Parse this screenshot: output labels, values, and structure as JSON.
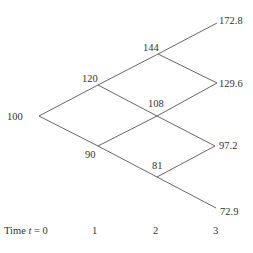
{
  "diagram": {
    "type": "binomial-tree",
    "nodes": [
      {
        "id": "n00",
        "value": "100",
        "x": 39,
        "y": 116,
        "label_x": 7,
        "label_y": 120,
        "anchor": "start"
      },
      {
        "id": "n10",
        "value": "120",
        "x": 98,
        "y": 85,
        "label_x": 82,
        "label_y": 82,
        "anchor": "start"
      },
      {
        "id": "n11",
        "value": "90",
        "x": 98,
        "y": 146,
        "label_x": 85,
        "label_y": 158,
        "anchor": "start"
      },
      {
        "id": "n20",
        "value": "144",
        "x": 158,
        "y": 54,
        "label_x": 143,
        "label_y": 51,
        "anchor": "start"
      },
      {
        "id": "n21",
        "value": "108",
        "x": 157,
        "y": 116,
        "label_x": 148,
        "label_y": 107,
        "anchor": "start"
      },
      {
        "id": "n22",
        "value": "81",
        "x": 157,
        "y": 177,
        "label_x": 152,
        "label_y": 169,
        "anchor": "start"
      },
      {
        "id": "n30",
        "value": "172.8",
        "x": 217,
        "y": 23,
        "label_x": 219,
        "label_y": 24,
        "anchor": "start"
      },
      {
        "id": "n31",
        "value": "129.6",
        "x": 217,
        "y": 83,
        "label_x": 219,
        "label_y": 87,
        "anchor": "start"
      },
      {
        "id": "n32",
        "value": "97.2",
        "x": 215,
        "y": 146,
        "label_x": 219,
        "label_y": 149,
        "anchor": "start"
      },
      {
        "id": "n33",
        "value": "72.9",
        "x": 216,
        "y": 208,
        "label_x": 220,
        "label_y": 215,
        "anchor": "start"
      }
    ],
    "edges": [
      [
        "n00",
        "n10"
      ],
      [
        "n00",
        "n11"
      ],
      [
        "n10",
        "n20"
      ],
      [
        "n10",
        "n21"
      ],
      [
        "n11",
        "n21"
      ],
      [
        "n11",
        "n22"
      ],
      [
        "n20",
        "n30"
      ],
      [
        "n20",
        "n31"
      ],
      [
        "n21",
        "n31"
      ],
      [
        "n21",
        "n32"
      ],
      [
        "n22",
        "n32"
      ],
      [
        "n22",
        "n33"
      ]
    ],
    "time_axis": {
      "prefix": "Time ",
      "variable": "t",
      "suffix": " = 0",
      "ticks": [
        "1",
        "2",
        "3"
      ]
    }
  }
}
